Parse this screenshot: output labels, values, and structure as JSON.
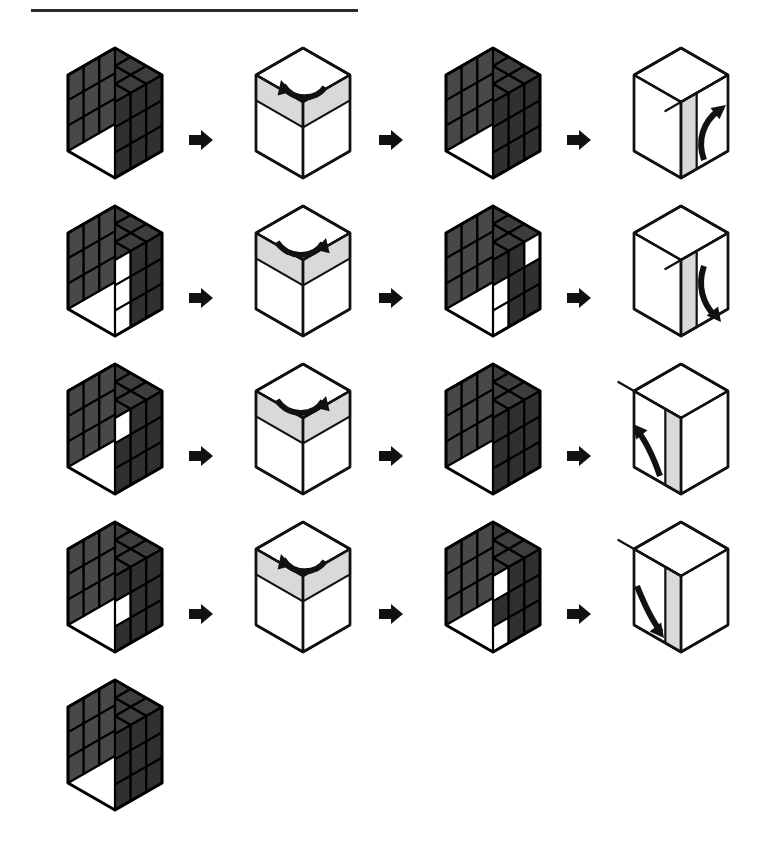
{
  "page": {
    "background_color": "#ffffff",
    "divider": {
      "name": "top-rule",
      "color": "#2b2b2b",
      "x": 31,
      "y": 9,
      "width": 327,
      "height": 3
    }
  },
  "palette": {
    "sticker_top": "#3d3d3d",
    "sticker_left": "#484848",
    "sticker_right": "#303030",
    "sticker_white": "#ffffff",
    "grid_line": "#000000",
    "band_gray": "#d9d9d9",
    "outline": "#111111",
    "arrow_black": "#111111"
  },
  "legend": {
    "step_arrow_icon": "right-arrow-icon",
    "rotation_top_cw": "top-layer-clockwise",
    "rotation_top_ccw": "top-layer-counterclockwise",
    "rotation_right_up": "right-column-up",
    "rotation_right_down": "right-column-down",
    "rotation_left_up": "left-column-up",
    "rotation_left_down": "left-column-down"
  },
  "rows": [
    {
      "index": 1,
      "y": 40,
      "panels": [
        {
          "kind": "cube",
          "name": "cube-state-1a",
          "x": 45,
          "white": {
            "top": [
              [
                0,
                1
              ]
            ],
            "left": [],
            "right": []
          }
        },
        {
          "kind": "arrow",
          "name": "step-arrow-1a",
          "x": 188,
          "y": 88
        },
        {
          "kind": "move",
          "name": "move-top-ccw-1",
          "x": 233,
          "move": "top-ccw"
        },
        {
          "kind": "arrow",
          "name": "step-arrow-1b",
          "x": 378,
          "y": 88
        },
        {
          "kind": "cube",
          "name": "cube-state-1b",
          "x": 423,
          "white": {
            "top": [
              [
                0,
                1
              ]
            ],
            "left": [],
            "right": []
          }
        },
        {
          "kind": "arrow",
          "name": "step-arrow-1c",
          "x": 566,
          "y": 88
        },
        {
          "kind": "move",
          "name": "move-right-up-1",
          "x": 611,
          "move": "right-up"
        }
      ]
    },
    {
      "index": 2,
      "y": 198,
      "panels": [
        {
          "kind": "cube",
          "name": "cube-state-2a",
          "x": 45,
          "white": {
            "top": [
              [
                0,
                1
              ]
            ],
            "left": [],
            "right": [
              [
                0,
                0
              ],
              [
                1,
                0
              ],
              [
                2,
                0
              ]
            ]
          }
        },
        {
          "kind": "arrow",
          "name": "step-arrow-2a",
          "x": 188,
          "y": 88
        },
        {
          "kind": "move",
          "name": "move-top-cw-2",
          "x": 233,
          "move": "top-cw"
        },
        {
          "kind": "arrow",
          "name": "step-arrow-2b",
          "x": 378,
          "y": 88
        },
        {
          "kind": "cube",
          "name": "cube-state-2b",
          "x": 423,
          "white": {
            "top": [
              [
                0,
                1
              ]
            ],
            "left": [],
            "right": [
              [
                0,
                2
              ],
              [
                1,
                0
              ],
              [
                2,
                0
              ]
            ]
          }
        },
        {
          "kind": "arrow",
          "name": "step-arrow-2c",
          "x": 566,
          "y": 88
        },
        {
          "kind": "move",
          "name": "move-right-down-2",
          "x": 611,
          "move": "right-down"
        }
      ]
    },
    {
      "index": 3,
      "y": 356,
      "panels": [
        {
          "kind": "cube",
          "name": "cube-state-3a",
          "x": 45,
          "white": {
            "top": [
              [
                0,
                1
              ]
            ],
            "left": [],
            "right": [
              [
                0,
                0
              ]
            ]
          }
        },
        {
          "kind": "arrow",
          "name": "step-arrow-3a",
          "x": 188,
          "y": 88
        },
        {
          "kind": "move",
          "name": "move-top-cw-3",
          "x": 233,
          "move": "top-cw"
        },
        {
          "kind": "arrow",
          "name": "step-arrow-3b",
          "x": 378,
          "y": 88
        },
        {
          "kind": "cube",
          "name": "cube-state-3b",
          "x": 423,
          "white": {
            "top": [
              [
                0,
                1
              ]
            ],
            "left": [],
            "right": []
          }
        },
        {
          "kind": "arrow",
          "name": "step-arrow-3c",
          "x": 566,
          "y": 88
        },
        {
          "kind": "move",
          "name": "move-left-up-3",
          "x": 611,
          "move": "left-up"
        }
      ]
    },
    {
      "index": 4,
      "y": 514,
      "panels": [
        {
          "kind": "cube",
          "name": "cube-state-4a",
          "x": 45,
          "white": {
            "top": [
              [
                0,
                1
              ]
            ],
            "left": [],
            "right": [
              [
                1,
                0
              ]
            ]
          }
        },
        {
          "kind": "arrow",
          "name": "step-arrow-4a",
          "x": 188,
          "y": 88
        },
        {
          "kind": "move",
          "name": "move-top-ccw-4",
          "x": 233,
          "move": "top-ccw"
        },
        {
          "kind": "arrow",
          "name": "step-arrow-4b",
          "x": 378,
          "y": 88
        },
        {
          "kind": "cube",
          "name": "cube-state-4b",
          "x": 423,
          "white": {
            "top": [
              [
                0,
                1
              ]
            ],
            "left": [],
            "right": [
              [
                0,
                0
              ],
              [
                2,
                0
              ]
            ]
          }
        },
        {
          "kind": "arrow",
          "name": "step-arrow-4c",
          "x": 566,
          "y": 88
        },
        {
          "kind": "move",
          "name": "move-left-down-4",
          "x": 611,
          "move": "left-down"
        }
      ]
    },
    {
      "index": 5,
      "y": 672,
      "panels": [
        {
          "kind": "cube",
          "name": "cube-state-5a",
          "x": 45,
          "white": {
            "top": [
              [
                0,
                1
              ]
            ],
            "left": [],
            "right": []
          }
        }
      ]
    }
  ]
}
